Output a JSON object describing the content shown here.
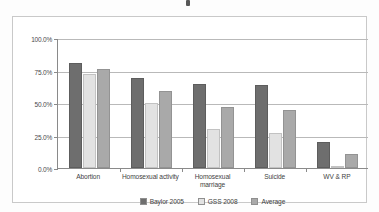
{
  "chart_data": {
    "type": "bar",
    "title": "",
    "xlabel": "",
    "ylabel": "",
    "ylim": [
      0,
      100
    ],
    "yticks": [
      0,
      25,
      50,
      75,
      100
    ],
    "ytick_labels": [
      "0.0%",
      "25.0%",
      "50.0%",
      "75.0%",
      "100.0%"
    ],
    "grid": true,
    "legend_position": "bottom-center",
    "categories": [
      "Abortion",
      "Homosexual activity",
      "Homosexual marriage",
      "Suicide",
      "WV & RP"
    ],
    "series": [
      {
        "name": "Baylor 2005",
        "color": "#6e6e6e",
        "values": [
          81,
          69,
          65,
          64,
          20
        ]
      },
      {
        "name": "GSS 2008",
        "color": "#e2e2e2",
        "values": [
          72,
          50,
          30,
          27,
          1
        ]
      },
      {
        "name": "Average",
        "color": "#a9a9a9",
        "values": [
          76,
          59,
          47,
          45,
          11
        ]
      }
    ]
  },
  "legend": {
    "items": [
      {
        "label": "Baylor 2005",
        "marker": "filled-square-dark"
      },
      {
        "label": "GSS 2008",
        "marker": "outlined-square-light"
      },
      {
        "label": "Average",
        "marker": "filled-square-medium"
      }
    ]
  }
}
